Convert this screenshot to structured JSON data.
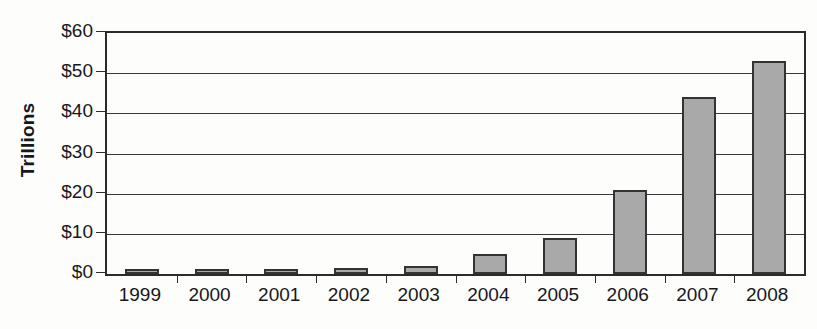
{
  "chart_data": {
    "type": "bar",
    "title": "",
    "xlabel": "",
    "ylabel": "Trillions",
    "categories": [
      "1999",
      "2000",
      "2001",
      "2002",
      "2003",
      "2004",
      "2005",
      "2006",
      "2007",
      "2008"
    ],
    "values": [
      0.8,
      0.9,
      1.0,
      1.5,
      2.0,
      5.0,
      9.0,
      21.0,
      44.0,
      53.0
    ],
    "ylim": [
      0,
      60
    ],
    "ytick_labels": [
      "$0",
      "$10",
      "$20",
      "$30",
      "$40",
      "$50",
      "$60"
    ],
    "ytick_values": [
      0,
      10,
      20,
      30,
      40,
      50,
      60
    ],
    "grid": true,
    "legend": "none",
    "bar_fill_color": "#a9a9a9",
    "bar_border_color": "#333333",
    "axis_color": "#2b2b2b",
    "text_color": "#17171a"
  }
}
